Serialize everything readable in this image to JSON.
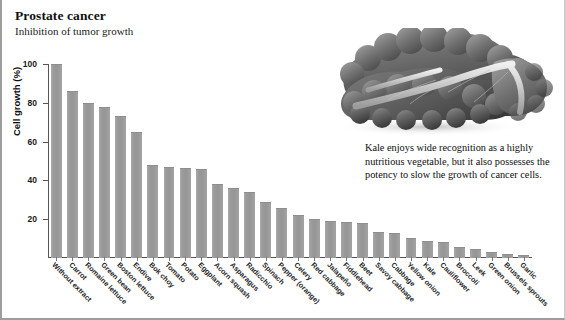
{
  "header": {
    "title": "Prostate cancer",
    "subtitle": "Inhibition of tumor growth"
  },
  "photo": {
    "alt_name": "kale-photograph",
    "caption": "Kale enjoys wide recognition as a highly nutritious vegetable, but it also possesses the potency to slow the growth of cancer cells."
  },
  "colors": {
    "bar": "#9a9a9a",
    "bar_edge": "#8e8e8e",
    "axis": "#555555",
    "text": "#111111",
    "background": "#ffffff",
    "border": "#9d9d9d"
  },
  "chart_data": {
    "type": "bar",
    "title": "Prostate cancer",
    "subtitle": "Inhibition of tumor growth",
    "xlabel": "",
    "ylabel": "Cell growth (%)",
    "ylim": [
      0,
      100
    ],
    "yticks": [
      20,
      40,
      60,
      80,
      100
    ],
    "grid": false,
    "legend": "none",
    "orientation": "vertical",
    "categories": [
      "Without extract",
      "Carrot",
      "Romaine lettuce",
      "Green bean",
      "Boston lettuce",
      "Endive",
      "Bok choy",
      "Tomato",
      "Potato",
      "Eggplant",
      "Acorn squash",
      "Asparagus",
      "Radicchio",
      "Spinach",
      "Pepper (orange)",
      "Celery",
      "Red cabbage",
      "Jalapeño",
      "Fiddlehead",
      "Beet",
      "Savoy cabbage",
      "Cabbage",
      "Yellow onion",
      "Kale",
      "Cauliflower",
      "Broccoli",
      "Leek",
      "Green onion",
      "Brussels sprouts",
      "Garlic"
    ],
    "values": [
      100,
      86,
      80,
      78,
      73,
      65,
      48,
      47,
      46.5,
      46,
      38,
      36,
      34,
      29,
      26,
      22,
      20,
      19,
      18.5,
      18,
      13.5,
      13,
      10.5,
      9,
      8,
      5.5,
      4.5,
      3,
      2,
      1.5
    ]
  }
}
